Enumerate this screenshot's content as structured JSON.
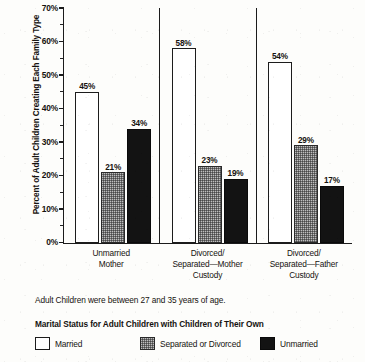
{
  "chart_data": {
    "type": "bar",
    "title": "",
    "xlabel": "",
    "ylabel": "Percent of Adult Children Creating Each Family Type",
    "ylim": [
      0,
      70
    ],
    "ytick_step": 10,
    "yminor_step": 5,
    "grid": false,
    "legend_position": "bottom",
    "categories": [
      "Unmarried\nMother",
      "Divorced/\nSeparated—Mother\nCustody",
      "Divorced/\nSeparated—Father\nCustody"
    ],
    "series": [
      {
        "name": "Married",
        "values": [
          45,
          58,
          54
        ],
        "color": "#ffffff"
      },
      {
        "name": "Separated or Divorced",
        "values": [
          21,
          23,
          29
        ],
        "color": "#6e6e6e"
      },
      {
        "name": "Unmarried",
        "values": [
          34,
          19,
          17
        ],
        "color": "#131313"
      }
    ],
    "data_labels": [
      "45%",
      "21%",
      "34%",
      "58%",
      "23%",
      "19%",
      "54%",
      "29%",
      "17%"
    ],
    "ytick_labels": [
      "70%",
      "60%",
      "50%",
      "40%",
      "30%",
      "20%",
      "10%",
      "0%"
    ],
    "annotation": "Adult Children were between 27 and 35 years of age."
  },
  "axis": {
    "y_title": "Percent of Adult Children Creating Each Family Type",
    "ticks": [
      {
        "label": "70%",
        "value": 70
      },
      {
        "label": "60%",
        "value": 60
      },
      {
        "label": "50%",
        "value": 50
      },
      {
        "label": "40%",
        "value": 40
      },
      {
        "label": "30%",
        "value": 30
      },
      {
        "label": "20%",
        "value": 20
      },
      {
        "label": "10%",
        "value": 10
      },
      {
        "label": "0%",
        "value": 0
      }
    ]
  },
  "groups": [
    {
      "label_lines": [
        "Unmarried",
        "Mother"
      ],
      "bars": [
        {
          "series": "Married",
          "value": 45,
          "label": "45%",
          "style": "white"
        },
        {
          "series": "Separated or Divorced",
          "value": 21,
          "label": "21%",
          "style": "gray"
        },
        {
          "series": "Unmarried",
          "value": 34,
          "label": "34%",
          "style": "black"
        }
      ]
    },
    {
      "label_lines": [
        "Divorced/",
        "Separated—Mother",
        "Custody"
      ],
      "bars": [
        {
          "series": "Married",
          "value": 58,
          "label": "58%",
          "style": "white"
        },
        {
          "series": "Separated or Divorced",
          "value": 23,
          "label": "23%",
          "style": "gray"
        },
        {
          "series": "Unmarried",
          "value": 19,
          "label": "19%",
          "style": "black"
        }
      ]
    },
    {
      "label_lines": [
        "Divorced/",
        "Separated—Father",
        "Custody"
      ],
      "bars": [
        {
          "series": "Married",
          "value": 54,
          "label": "54%",
          "style": "white"
        },
        {
          "series": "Separated or Divorced",
          "value": 29,
          "label": "29%",
          "style": "gray"
        },
        {
          "series": "Unmarried",
          "value": 17,
          "label": "17%",
          "style": "black"
        }
      ]
    }
  ],
  "footnote": "Adult Children were between 27 and 35 years of age.",
  "legend": {
    "title": "Marital Status for Adult Children with Children of Their Own",
    "items": [
      {
        "label": "Married",
        "style": "white"
      },
      {
        "label": "Separated or Divorced",
        "style": "gray"
      },
      {
        "label": "Unmarried",
        "style": "black"
      }
    ]
  }
}
